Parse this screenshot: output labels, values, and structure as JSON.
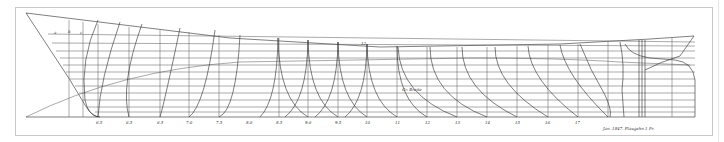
{
  "drawing": {
    "type": "ship lines plan",
    "background": "#ffffff",
    "line_color": "#2a2a2a",
    "frame_color": "#c8c8c8",
    "station_labels": [
      "6.5",
      "6.5",
      "6.5",
      "7.0",
      "7.5",
      "8.0",
      "8.5",
      "9.0",
      "9.5",
      "10",
      "11",
      "12",
      "13",
      "14",
      "15",
      "16",
      "17"
    ],
    "bow_marks": [
      "a",
      "b",
      "c"
    ],
    "midship_note": "Gr. Breite",
    "deck_mark": "12",
    "signature": "Jan. 1847. Plaugehn 1 Fr.",
    "stern_marks": [
      "8",
      "7",
      "6",
      "5",
      "4",
      "3",
      "2",
      "1"
    ]
  }
}
